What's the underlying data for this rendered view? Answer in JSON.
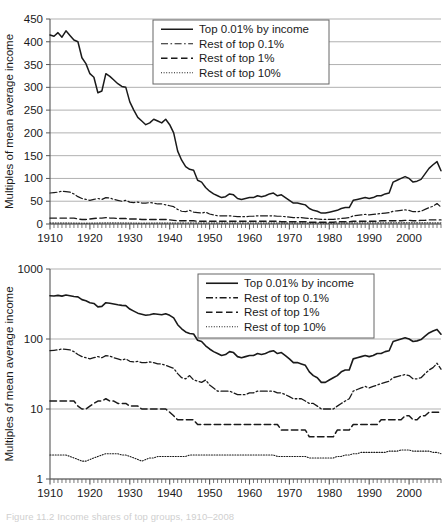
{
  "figure": {
    "caption_fragment": "Figure 11.2   Income shares of top groups, 1910–2008",
    "background_color": "#ffffff",
    "line_color": "#1a1a1a",
    "grid_color": "#a8a8a8",
    "axis_color": "#555555"
  },
  "chart_data": [
    {
      "id": "chart-linear",
      "type": "line",
      "title": "",
      "subtitle": "",
      "xlabel": "",
      "ylabel": "Multiples of mean average income",
      "yscale": "linear",
      "ylim": [
        0,
        450
      ],
      "yticks": [
        0,
        50,
        100,
        150,
        200,
        250,
        300,
        350,
        400,
        450
      ],
      "ytick_labels": [
        "0",
        "50",
        "100",
        "150",
        "200",
        "250",
        "300",
        "350",
        "400",
        "450"
      ],
      "xlim": [
        1910,
        2008
      ],
      "xticks": [
        1910,
        1920,
        1930,
        1940,
        1950,
        1960,
        1970,
        1980,
        1990,
        2000
      ],
      "xtick_labels": [
        "1910",
        "1920",
        "1930",
        "1940",
        "1950",
        "1960",
        "1970",
        "1980",
        "1990",
        "2000"
      ],
      "minor_xtick_step": 1,
      "grid": true,
      "grid_axis": "y",
      "legend_position": "top-center-right",
      "legend_entries": [
        {
          "label": "Top 0.01% by income",
          "dash": "solid"
        },
        {
          "label": "Rest of top 0.1%",
          "dash": "dashdot"
        },
        {
          "label": "Rest of top 1%",
          "dash": "dashed"
        },
        {
          "label": "Rest of top 10%",
          "dash": "dotted"
        }
      ],
      "x": [
        1910,
        1911,
        1912,
        1913,
        1914,
        1915,
        1916,
        1917,
        1918,
        1919,
        1920,
        1921,
        1922,
        1923,
        1924,
        1925,
        1926,
        1927,
        1928,
        1929,
        1930,
        1931,
        1932,
        1933,
        1934,
        1935,
        1936,
        1937,
        1938,
        1939,
        1940,
        1941,
        1942,
        1943,
        1944,
        1945,
        1946,
        1947,
        1948,
        1949,
        1950,
        1951,
        1952,
        1953,
        1954,
        1955,
        1956,
        1957,
        1958,
        1959,
        1960,
        1961,
        1962,
        1963,
        1964,
        1965,
        1966,
        1967,
        1968,
        1969,
        1970,
        1971,
        1972,
        1973,
        1974,
        1975,
        1976,
        1977,
        1978,
        1979,
        1980,
        1981,
        1982,
        1983,
        1984,
        1985,
        1986,
        1987,
        1988,
        1989,
        1990,
        1991,
        1992,
        1993,
        1994,
        1995,
        1996,
        1997,
        1998,
        1999,
        2000,
        2001,
        2002,
        2003,
        2004,
        2005,
        2006,
        2007,
        2008
      ],
      "series": [
        {
          "name": "Top 0.01% by income",
          "dash": "solid",
          "width": 1.5,
          "values": [
            415,
            412,
            420,
            410,
            424,
            414,
            404,
            400,
            365,
            352,
            330,
            322,
            288,
            292,
            330,
            324,
            316,
            308,
            302,
            300,
            268,
            250,
            234,
            226,
            218,
            222,
            230,
            226,
            222,
            230,
            218,
            200,
            160,
            140,
            126,
            120,
            118,
            96,
            92,
            80,
            72,
            66,
            62,
            58,
            60,
            66,
            64,
            56,
            54,
            56,
            58,
            58,
            62,
            60,
            62,
            66,
            68,
            62,
            64,
            58,
            52,
            46,
            46,
            44,
            42,
            34,
            30,
            28,
            24,
            24,
            26,
            28,
            30,
            34,
            36,
            36,
            52,
            54,
            56,
            58,
            56,
            58,
            62,
            62,
            66,
            68,
            92,
            96,
            100,
            104,
            100,
            92,
            94,
            98,
            110,
            122,
            130,
            137,
            117
          ]
        },
        {
          "name": "Rest of top 0.1%",
          "dash": "dashdot",
          "width": 1.2,
          "values": [
            68,
            69,
            70,
            72,
            71,
            70,
            66,
            60,
            56,
            54,
            52,
            54,
            56,
            54,
            58,
            57,
            54,
            52,
            50,
            52,
            48,
            47,
            48,
            46,
            46,
            47,
            46,
            44,
            44,
            42,
            40,
            38,
            32,
            28,
            27,
            30,
            26,
            25,
            24,
            26,
            22,
            20,
            18,
            18,
            18,
            18,
            17,
            16,
            16,
            16,
            17,
            17,
            18,
            18,
            18,
            18,
            18,
            17,
            17,
            16,
            15,
            14,
            14,
            14,
            13,
            12,
            12,
            11,
            10,
            10,
            10,
            10,
            11,
            12,
            13,
            14,
            18,
            19,
            20,
            21,
            20,
            21,
            22,
            23,
            24,
            25,
            28,
            29,
            30,
            31,
            30,
            27,
            27,
            28,
            32,
            36,
            39,
            45,
            37
          ]
        },
        {
          "name": "Rest of top 1%",
          "dash": "dashed",
          "width": 1.4,
          "values": [
            13,
            13,
            13,
            13,
            13,
            13,
            13,
            11,
            10,
            10,
            11,
            12,
            13,
            13,
            14,
            13,
            13,
            12,
            12,
            12,
            11,
            11,
            11,
            10,
            10,
            10,
            10,
            10,
            10,
            10,
            9,
            8,
            7,
            7,
            7,
            7,
            7,
            6,
            6,
            6,
            6,
            6,
            6,
            6,
            6,
            6,
            6,
            6,
            6,
            6,
            6,
            6,
            6,
            6,
            6,
            6,
            6,
            6,
            5,
            5,
            5,
            5,
            5,
            5,
            5,
            4,
            4,
            4,
            4,
            4,
            4,
            4,
            5,
            5,
            5,
            5,
            6,
            6,
            6,
            6,
            6,
            6,
            6,
            7,
            7,
            7,
            7,
            7,
            7,
            8,
            8,
            7,
            7,
            8,
            8,
            9,
            9,
            9,
            9
          ]
        },
        {
          "name": "Rest of top 10%",
          "dash": "dotted",
          "width": 1.0,
          "values": [
            2.2,
            2.2,
            2.2,
            2.2,
            2.2,
            2.1,
            2.0,
            1.9,
            1.8,
            1.8,
            1.9,
            2.0,
            2.1,
            2.2,
            2.3,
            2.3,
            2.3,
            2.3,
            2.2,
            2.2,
            2.1,
            2.0,
            1.9,
            1.8,
            1.9,
            2.0,
            2.0,
            2.1,
            2.1,
            2.1,
            2.1,
            2.1,
            2.1,
            2.1,
            2.1,
            2.2,
            2.2,
            2.2,
            2.2,
            2.2,
            2.2,
            2.2,
            2.2,
            2.2,
            2.2,
            2.2,
            2.2,
            2.2,
            2.2,
            2.2,
            2.2,
            2.2,
            2.2,
            2.2,
            2.2,
            2.2,
            2.2,
            2.1,
            2.1,
            2.1,
            2.1,
            2.1,
            2.1,
            2.1,
            2.1,
            2.0,
            2.0,
            2.0,
            2.0,
            2.0,
            2.0,
            2.0,
            2.1,
            2.1,
            2.2,
            2.2,
            2.3,
            2.3,
            2.4,
            2.4,
            2.4,
            2.4,
            2.4,
            2.4,
            2.4,
            2.5,
            2.5,
            2.5,
            2.6,
            2.6,
            2.6,
            2.5,
            2.5,
            2.5,
            2.5,
            2.5,
            2.4,
            2.4,
            2.3
          ]
        }
      ]
    },
    {
      "id": "chart-log",
      "type": "line",
      "title": "",
      "subtitle": "",
      "xlabel": "",
      "ylabel": "Multiples of mean average income",
      "yscale": "log",
      "ylim": [
        1,
        1000
      ],
      "yticks": [
        1,
        10,
        100,
        1000
      ],
      "ytick_labels": [
        "1",
        "10",
        "100",
        "1000"
      ],
      "xlim": [
        1910,
        2008
      ],
      "xticks": [
        1910,
        1920,
        1930,
        1940,
        1950,
        1960,
        1970,
        1980,
        1990,
        2000
      ],
      "xtick_labels": [
        "1910",
        "1920",
        "1930",
        "1940",
        "1950",
        "1960",
        "1970",
        "1980",
        "1990",
        "2000"
      ],
      "minor_xtick_step": 1,
      "grid": true,
      "grid_axis": "y",
      "legend_position": "top-center-right",
      "legend_entries": [
        {
          "label": "Top 0.01% by income",
          "dash": "solid"
        },
        {
          "label": "Rest of top 0.1%",
          "dash": "dashdot"
        },
        {
          "label": "Rest of top 1%",
          "dash": "dashed"
        },
        {
          "label": "Rest of top 10%",
          "dash": "dotted"
        }
      ],
      "x": [
        1910,
        1911,
        1912,
        1913,
        1914,
        1915,
        1916,
        1917,
        1918,
        1919,
        1920,
        1921,
        1922,
        1923,
        1924,
        1925,
        1926,
        1927,
        1928,
        1929,
        1930,
        1931,
        1932,
        1933,
        1934,
        1935,
        1936,
        1937,
        1938,
        1939,
        1940,
        1941,
        1942,
        1943,
        1944,
        1945,
        1946,
        1947,
        1948,
        1949,
        1950,
        1951,
        1952,
        1953,
        1954,
        1955,
        1956,
        1957,
        1958,
        1959,
        1960,
        1961,
        1962,
        1963,
        1964,
        1965,
        1966,
        1967,
        1968,
        1969,
        1970,
        1971,
        1972,
        1973,
        1974,
        1975,
        1976,
        1977,
        1978,
        1979,
        1980,
        1981,
        1982,
        1983,
        1984,
        1985,
        1986,
        1987,
        1988,
        1989,
        1990,
        1991,
        1992,
        1993,
        1994,
        1995,
        1996,
        1997,
        1998,
        1999,
        2000,
        2001,
        2002,
        2003,
        2004,
        2005,
        2006,
        2007,
        2008
      ],
      "series": [
        {
          "name": "Top 0.01% by income",
          "dash": "solid",
          "width": 1.6,
          "values": [
            415,
            412,
            420,
            410,
            424,
            414,
            404,
            400,
            365,
            352,
            330,
            322,
            288,
            292,
            330,
            324,
            316,
            308,
            302,
            300,
            268,
            250,
            234,
            226,
            218,
            222,
            230,
            226,
            222,
            230,
            218,
            200,
            160,
            140,
            126,
            120,
            118,
            96,
            92,
            80,
            72,
            66,
            62,
            58,
            60,
            66,
            64,
            56,
            54,
            56,
            58,
            58,
            62,
            60,
            62,
            66,
            68,
            62,
            64,
            58,
            52,
            46,
            46,
            44,
            42,
            34,
            30,
            28,
            24,
            24,
            26,
            28,
            30,
            34,
            36,
            36,
            52,
            54,
            56,
            58,
            56,
            58,
            62,
            62,
            66,
            68,
            92,
            96,
            100,
            104,
            100,
            92,
            94,
            98,
            110,
            122,
            130,
            137,
            117
          ]
        },
        {
          "name": "Rest of top 0.1%",
          "dash": "dashdot",
          "width": 1.3,
          "values": [
            68,
            69,
            70,
            72,
            71,
            70,
            66,
            60,
            56,
            54,
            52,
            54,
            56,
            54,
            58,
            57,
            54,
            52,
            50,
            52,
            48,
            47,
            48,
            46,
            46,
            47,
            46,
            44,
            44,
            42,
            40,
            38,
            32,
            28,
            27,
            30,
            26,
            25,
            24,
            26,
            22,
            20,
            18,
            18,
            18,
            18,
            17,
            16,
            16,
            16,
            17,
            17,
            18,
            18,
            18,
            18,
            18,
            17,
            17,
            16,
            15,
            14,
            14,
            14,
            13,
            12,
            12,
            11,
            10,
            10,
            10,
            10,
            11,
            12,
            13,
            14,
            18,
            19,
            20,
            21,
            20,
            21,
            22,
            23,
            24,
            25,
            28,
            29,
            30,
            31,
            30,
            27,
            27,
            28,
            32,
            36,
            39,
            45,
            37
          ]
        },
        {
          "name": "Rest of top 1%",
          "dash": "dashed",
          "width": 1.5,
          "values": [
            13,
            13,
            13,
            13,
            13,
            13,
            13,
            11,
            10,
            10,
            11,
            12,
            13,
            13,
            14,
            13,
            13,
            12,
            12,
            12,
            11,
            11,
            11,
            10,
            10,
            10,
            10,
            10,
            10,
            10,
            9,
            8,
            7,
            7,
            7,
            7,
            7,
            6,
            6,
            6,
            6,
            6,
            6,
            6,
            6,
            6,
            6,
            6,
            6,
            6,
            6,
            6,
            6,
            6,
            6,
            6,
            6,
            6,
            5,
            5,
            5,
            5,
            5,
            5,
            5,
            4,
            4,
            4,
            4,
            4,
            4,
            4,
            5,
            5,
            5,
            5,
            6,
            6,
            6,
            6,
            6,
            6,
            6,
            7,
            7,
            7,
            7,
            7,
            7,
            8,
            8,
            7,
            7,
            8,
            8,
            9,
            9,
            9,
            9
          ]
        },
        {
          "name": "Rest of top 10%",
          "dash": "dotted",
          "width": 1.1,
          "values": [
            2.2,
            2.2,
            2.2,
            2.2,
            2.2,
            2.1,
            2.0,
            1.9,
            1.8,
            1.8,
            1.9,
            2.0,
            2.1,
            2.2,
            2.3,
            2.3,
            2.3,
            2.3,
            2.2,
            2.2,
            2.1,
            2.0,
            1.9,
            1.8,
            1.9,
            2.0,
            2.0,
            2.1,
            2.1,
            2.1,
            2.1,
            2.1,
            2.1,
            2.1,
            2.1,
            2.2,
            2.2,
            2.2,
            2.2,
            2.2,
            2.2,
            2.2,
            2.2,
            2.2,
            2.2,
            2.2,
            2.2,
            2.2,
            2.2,
            2.2,
            2.2,
            2.2,
            2.2,
            2.2,
            2.2,
            2.2,
            2.2,
            2.1,
            2.1,
            2.1,
            2.1,
            2.1,
            2.1,
            2.1,
            2.1,
            2.0,
            2.0,
            2.0,
            2.0,
            2.0,
            2.0,
            2.0,
            2.1,
            2.1,
            2.2,
            2.2,
            2.3,
            2.3,
            2.4,
            2.4,
            2.4,
            2.4,
            2.4,
            2.4,
            2.4,
            2.5,
            2.5,
            2.5,
            2.6,
            2.6,
            2.6,
            2.5,
            2.5,
            2.5,
            2.5,
            2.5,
            2.4,
            2.4,
            2.3
          ]
        }
      ]
    }
  ]
}
